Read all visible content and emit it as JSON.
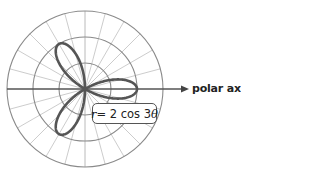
{
  "chart_data": {
    "type": "line",
    "subtype": "polar-rose",
    "equation": "r = 2 cos 3θ",
    "equation_parts": {
      "lhs": "r",
      "eq": " = 2 cos 3",
      "var": "θ"
    },
    "axis_label": "polar axis",
    "radial_gridlines": [
      1,
      2,
      3
    ],
    "angular_gridline_step_deg": 15,
    "petals": 3,
    "petal_angles_deg": [
      0,
      120,
      240
    ],
    "max_r": 2,
    "grid": true,
    "colors": {
      "curve": "#555555",
      "grid": "#bfbfbf",
      "circles": "#8a8a8a",
      "axis": "#555555"
    }
  }
}
